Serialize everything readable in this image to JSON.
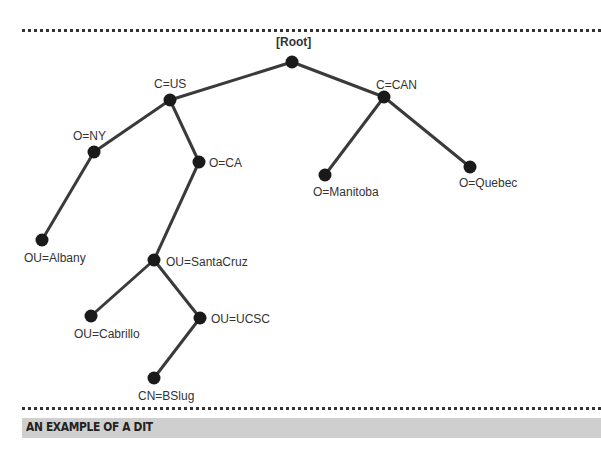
{
  "figure": {
    "caption": "AN EXAMPLE OF A DIT",
    "colors": {
      "edge": "#3a3a3a",
      "node": "#1a1a1a",
      "caption_bg": "#cfcfcf",
      "text": "#333333"
    }
  },
  "tree": {
    "nodes": [
      {
        "id": "root",
        "label": "[Root]"
      },
      {
        "id": "us",
        "label": "C=US"
      },
      {
        "id": "can",
        "label": "C=CAN"
      },
      {
        "id": "ny",
        "label": "O=NY"
      },
      {
        "id": "ca",
        "label": "O=CA"
      },
      {
        "id": "manitoba",
        "label": "O=Manitoba"
      },
      {
        "id": "quebec",
        "label": "O=Quebec"
      },
      {
        "id": "albany",
        "label": "OU=Albany"
      },
      {
        "id": "santacruz",
        "label": "OU=SantaCruz"
      },
      {
        "id": "cabrillo",
        "label": "OU=Cabrillo"
      },
      {
        "id": "ucsc",
        "label": "OU=UCSC"
      },
      {
        "id": "bslug",
        "label": "CN=BSlug"
      }
    ],
    "edges": [
      [
        "root",
        "us"
      ],
      [
        "root",
        "can"
      ],
      [
        "us",
        "ny"
      ],
      [
        "us",
        "ca"
      ],
      [
        "can",
        "manitoba"
      ],
      [
        "can",
        "quebec"
      ],
      [
        "ny",
        "albany"
      ],
      [
        "ca",
        "santacruz"
      ],
      [
        "santacruz",
        "cabrillo"
      ],
      [
        "santacruz",
        "ucsc"
      ],
      [
        "ucsc",
        "bslug"
      ]
    ]
  }
}
